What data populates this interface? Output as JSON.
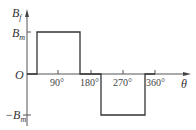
{
  "diagram": {
    "y_axis_label": "B",
    "y_axis_label_sub": "f",
    "x_axis_label": "θ",
    "origin_label": "O",
    "level_pos_label": "B",
    "level_pos_sub": "m",
    "level_neg_prefix": "−B",
    "level_neg_sub": "m",
    "ticks": [
      {
        "label": "90°"
      },
      {
        "label": "180°"
      },
      {
        "label": "270°"
      },
      {
        "label": "360°"
      }
    ],
    "waveform": {
      "type": "rectangular pulse",
      "segments": [
        {
          "from_deg": 0,
          "to_deg": 30,
          "value": "0"
        },
        {
          "from_deg": 30,
          "to_deg": 150,
          "value": "Bm"
        },
        {
          "from_deg": 150,
          "to_deg": 210,
          "value": "0"
        },
        {
          "from_deg": 210,
          "to_deg": 330,
          "value": "-Bm"
        },
        {
          "from_deg": 330,
          "to_deg": 360,
          "value": "0"
        }
      ]
    },
    "colors": {
      "axis": "#555555",
      "waveform": "#333333",
      "background": "#ffffff"
    }
  }
}
